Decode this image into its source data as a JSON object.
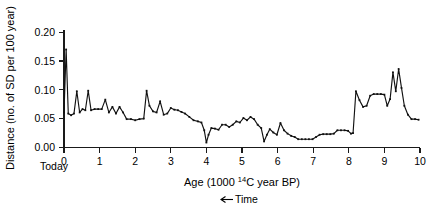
{
  "chart_data": {
    "type": "line",
    "title": "",
    "subtitle": "",
    "xlabel": "Age (1000 14C year BP)",
    "xlabel_parts": {
      "pre": "Age (1000 ",
      "sup": "14",
      "post": "C year BP)"
    },
    "ylabel": "Distance (no. of SD per 100 year)",
    "xlim": [
      0,
      10
    ],
    "ylim": [
      0.0,
      0.21
    ],
    "xticks": [
      0,
      1,
      2,
      3,
      4,
      5,
      6,
      7,
      8,
      9,
      10
    ],
    "xtick_labels": [
      "0",
      "1",
      "2",
      "3",
      "4",
      "5",
      "6",
      "7",
      "8",
      "9",
      "10"
    ],
    "yticks": [
      0.0,
      0.05,
      0.1,
      0.15,
      0.2
    ],
    "ytick_labels": [
      "0.00",
      "0.05",
      "0.10",
      "0.15",
      "0.20"
    ],
    "grid": false,
    "legend": null,
    "markers": "small-square",
    "annotations": [
      {
        "name": "today-label",
        "text": "Today",
        "x": 0.0,
        "position": "below-axis-left"
      },
      {
        "name": "time-direction",
        "text": "Time",
        "arrow": "left",
        "position": "below-xlabel"
      }
    ],
    "series": [
      {
        "name": "distance",
        "color": "#111111",
        "x": [
          0.0,
          0.06,
          0.12,
          0.2,
          0.28,
          0.36,
          0.44,
          0.52,
          0.6,
          0.68,
          0.76,
          0.86,
          0.96,
          1.06,
          1.16,
          1.26,
          1.36,
          1.46,
          1.56,
          1.66,
          1.76,
          1.88,
          2.0,
          2.12,
          2.24,
          2.32,
          2.4,
          2.5,
          2.6,
          2.7,
          2.8,
          2.9,
          3.0,
          3.1,
          3.2,
          3.3,
          3.4,
          3.52,
          3.64,
          3.76,
          3.86,
          3.94,
          4.0,
          4.06,
          4.14,
          4.24,
          4.34,
          4.44,
          4.54,
          4.64,
          4.74,
          4.84,
          4.94,
          5.04,
          5.14,
          5.24,
          5.34,
          5.44,
          5.54,
          5.62,
          5.7,
          5.78,
          5.88,
          5.98,
          6.08,
          6.18,
          6.28,
          6.38,
          6.48,
          6.58,
          6.68,
          6.78,
          6.88,
          6.98,
          7.08,
          7.18,
          7.28,
          7.38,
          7.48,
          7.58,
          7.68,
          7.78,
          7.88,
          7.98,
          8.06,
          8.12,
          8.2,
          8.3,
          8.4,
          8.5,
          8.6,
          8.7,
          8.8,
          8.9,
          9.0,
          9.08,
          9.16,
          9.24,
          9.32,
          9.4,
          9.48,
          9.56,
          9.66,
          9.76,
          9.86,
          9.96
        ],
        "y": [
          0.062,
          0.175,
          0.06,
          0.057,
          0.06,
          0.1,
          0.062,
          0.068,
          0.066,
          0.101,
          0.066,
          0.068,
          0.068,
          0.068,
          0.085,
          0.062,
          0.072,
          0.06,
          0.072,
          0.062,
          0.05,
          0.05,
          0.048,
          0.05,
          0.051,
          0.101,
          0.074,
          0.064,
          0.062,
          0.082,
          0.058,
          0.06,
          0.07,
          0.067,
          0.066,
          0.063,
          0.06,
          0.054,
          0.048,
          0.046,
          0.044,
          0.03,
          0.008,
          0.022,
          0.034,
          0.033,
          0.031,
          0.04,
          0.04,
          0.036,
          0.04,
          0.046,
          0.044,
          0.052,
          0.048,
          0.054,
          0.05,
          0.04,
          0.034,
          0.01,
          0.022,
          0.032,
          0.026,
          0.022,
          0.043,
          0.03,
          0.024,
          0.02,
          0.018,
          0.014,
          0.014,
          0.014,
          0.014,
          0.014,
          0.018,
          0.022,
          0.023,
          0.023,
          0.023,
          0.024,
          0.03,
          0.03,
          0.03,
          0.029,
          0.024,
          0.025,
          0.1,
          0.084,
          0.072,
          0.074,
          0.092,
          0.095,
          0.095,
          0.095,
          0.094,
          0.074,
          0.086,
          0.134,
          0.1,
          0.14,
          0.106,
          0.074,
          0.058,
          0.05,
          0.05,
          0.049
        ]
      }
    ]
  },
  "axes_geometry": {
    "plot_left": 64,
    "plot_right": 420,
    "plot_top": 30,
    "plot_bottom": 147
  }
}
